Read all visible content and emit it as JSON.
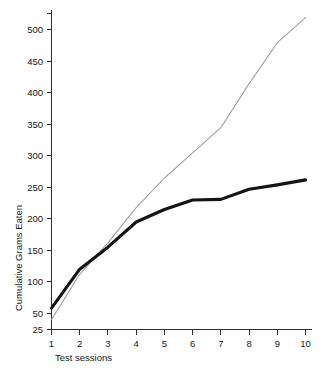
{
  "chart_data": {
    "type": "line",
    "title": "",
    "xlabel": "Test sessions",
    "ylabel": "Cumulative Grams Eaten",
    "x": [
      1,
      2,
      3,
      4,
      5,
      6,
      7,
      8,
      9,
      10
    ],
    "xticklabels": [
      "1",
      "2",
      "3",
      "4",
      "5",
      "6",
      "7",
      "8",
      "9",
      "10"
    ],
    "yticklabels": [
      "25",
      "50",
      "100",
      "150",
      "200",
      "250",
      "300",
      "350",
      "400",
      "450",
      "500"
    ],
    "ytickvalues": [
      25,
      50,
      100,
      150,
      200,
      250,
      300,
      350,
      400,
      450,
      500
    ],
    "xlim": [
      1,
      10
    ],
    "ylim": [
      25,
      532
    ],
    "grid": false,
    "legend": "none",
    "series": [
      {
        "name": "thick-line",
        "style": "thick solid black",
        "color": "#121416",
        "values": [
          58,
          120,
          155,
          195,
          215,
          230,
          231,
          247,
          254,
          262
        ]
      },
      {
        "name": "thin-line",
        "style": "thin solid gray",
        "color": "#9b9ea1",
        "values": [
          40,
          112,
          162,
          218,
          265,
          305,
          345,
          415,
          480,
          520
        ]
      }
    ],
    "annotations": []
  },
  "caption": {
    "partial_text": ""
  }
}
